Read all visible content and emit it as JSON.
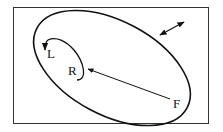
{
  "diagram": {
    "labels": {
      "L": "L",
      "R": "R",
      "F": "F"
    },
    "colors": {
      "stroke": "#111111",
      "frame": "#333333",
      "background": "#ffffff"
    },
    "elements": [
      {
        "id": "outer-ellipse",
        "type": "ellipse",
        "description": "large tilted ellipse boundary"
      },
      {
        "id": "inner-loop",
        "type": "curve",
        "description": "small curved loop from R to L with arrowhead at L"
      },
      {
        "id": "arrow-F-to-R",
        "type": "arrow",
        "from": "F",
        "to": "R"
      },
      {
        "id": "double-arrow",
        "type": "double-headed-arrow",
        "description": "outside ellipse, upper right"
      }
    ]
  }
}
